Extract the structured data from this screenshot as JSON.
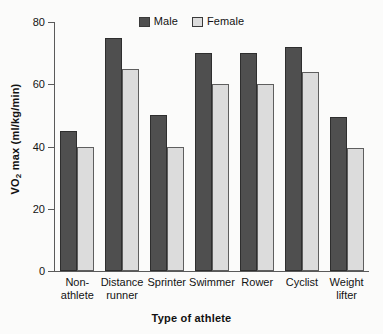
{
  "chart_data": {
    "type": "bar",
    "title": "",
    "subtitle": "",
    "xlabel": "Type of athlete",
    "ylabel": "VO2 max (ml/kg/min)",
    "ylabel_prefix": "VO",
    "ylabel_sub": "2",
    "ylabel_suffix": " max (ml/kg/min)",
    "categories": [
      "Non-athlete",
      "Distance runner",
      "Sprinter",
      "Swimmer",
      "Rower",
      "Cyclist",
      "Weight lifter"
    ],
    "category_lines": [
      [
        "Non-",
        "athlete"
      ],
      [
        "Distance",
        "runner"
      ],
      [
        "Sprinter",
        ""
      ],
      [
        "Swimmer",
        ""
      ],
      [
        "Rower",
        ""
      ],
      [
        "Cyclist",
        ""
      ],
      [
        "Weight",
        "lifter"
      ]
    ],
    "series": [
      {
        "name": "Male",
        "color": "#4f4f4f",
        "values": [
          45,
          75,
          50,
          70,
          70,
          72,
          49.5
        ]
      },
      {
        "name": "Female",
        "color": "#dcdcdc",
        "values": [
          40,
          65,
          40,
          60,
          60,
          64,
          39.5
        ]
      }
    ],
    "ylim": [
      0,
      80
    ],
    "yticks": [
      0,
      20,
      40,
      60,
      80
    ],
    "ytick_labels": [
      "0",
      "20",
      "40",
      "60",
      "80"
    ],
    "grid": false,
    "legend_position": "top-center"
  },
  "legend": {
    "entries": [
      {
        "label": "Male",
        "color": "#4f4f4f"
      },
      {
        "label": "Female",
        "color": "#dcdcdc"
      }
    ]
  }
}
